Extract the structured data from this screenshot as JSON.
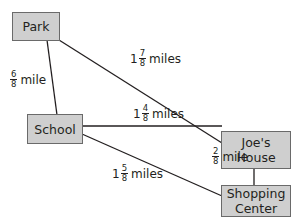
{
  "nodes": {
    "park": {
      "label": "Park"
    },
    "school": {
      "label": "School"
    },
    "joes_house": {
      "line1": "Joe's",
      "line2": "House"
    },
    "shopping_center": {
      "line1": "Shopping",
      "line2": "Center"
    }
  },
  "edges": {
    "park_school": {
      "whole": "",
      "num": "6",
      "den": "8",
      "unit": "mile"
    },
    "park_joes": {
      "whole": "1",
      "num": "7",
      "den": "8",
      "unit": "miles"
    },
    "school_joes": {
      "whole": "1",
      "num": "4",
      "den": "8",
      "unit": "miles"
    },
    "school_shopping": {
      "whole": "1",
      "num": "5",
      "den": "8",
      "unit": "miles"
    },
    "joes_shopping": {
      "whole": "",
      "num": "2",
      "den": "8",
      "unit": "mile"
    }
  },
  "colors": {
    "node_fill": "#cfcfcf",
    "node_border": "#6a6a6a",
    "line": "#231f20"
  }
}
